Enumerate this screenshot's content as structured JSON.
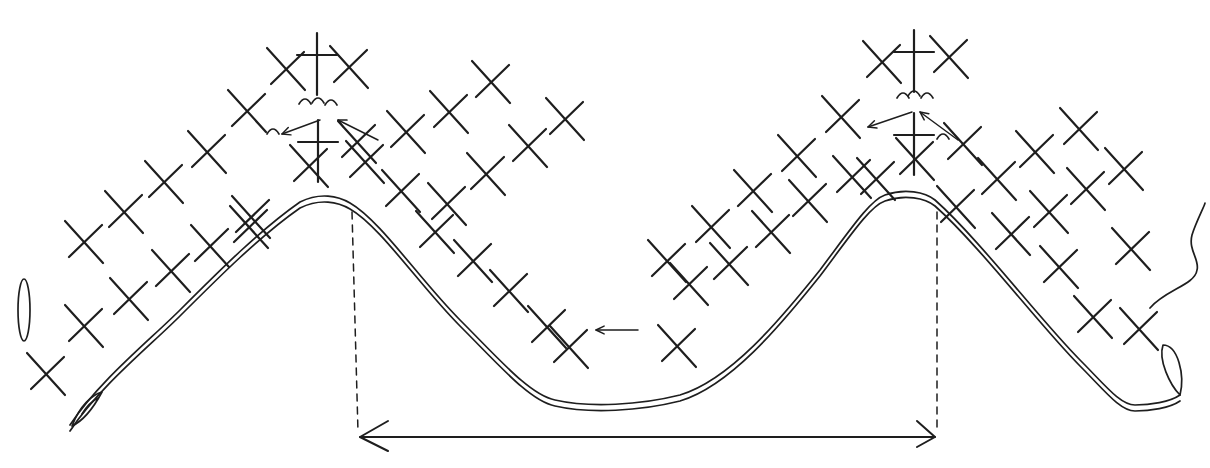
{
  "diagram": {
    "title": "",
    "type": "crochet-stitch-chart",
    "ink_color": "#1e1e1e",
    "background": "#ffffff",
    "symbols": {
      "sc": "single-crochet-x",
      "tr": "treble-cross",
      "ch": "chain-oval",
      "join": "hook-join-mark",
      "loop": "loop-end"
    },
    "single_crochet": [
      [
        47,
        375
      ],
      [
        85,
        327
      ],
      [
        130,
        300
      ],
      [
        172,
        272
      ],
      [
        211,
        247
      ],
      [
        252,
        218
      ],
      [
        85,
        243
      ],
      [
        125,
        213
      ],
      [
        165,
        183
      ],
      [
        208,
        153
      ],
      [
        248,
        112
      ],
      [
        287,
        70
      ],
      [
        350,
        68
      ],
      [
        358,
        143
      ],
      [
        310,
        167
      ],
      [
        250,
        228
      ],
      [
        366,
        163
      ],
      [
        407,
        133
      ],
      [
        450,
        113
      ],
      [
        492,
        83
      ],
      [
        402,
        192
      ],
      [
        436,
        233
      ],
      [
        474,
        262
      ],
      [
        510,
        292
      ],
      [
        548,
        328
      ],
      [
        570,
        348
      ],
      [
        448,
        205
      ],
      [
        487,
        175
      ],
      [
        529,
        147
      ],
      [
        566,
        120
      ],
      [
        678,
        347
      ],
      [
        690,
        285
      ],
      [
        730,
        265
      ],
      [
        772,
        233
      ],
      [
        809,
        202
      ],
      [
        853,
        178
      ],
      [
        668,
        262
      ],
      [
        712,
        228
      ],
      [
        754,
        192
      ],
      [
        798,
        157
      ],
      [
        842,
        118
      ],
      [
        883,
        63
      ],
      [
        950,
        58
      ],
      [
        964,
        145
      ],
      [
        916,
        160
      ],
      [
        877,
        180
      ],
      [
        957,
        208
      ],
      [
        998,
        180
      ],
      [
        1036,
        153
      ],
      [
        1080,
        130
      ],
      [
        1012,
        235
      ],
      [
        1050,
        213
      ],
      [
        1087,
        190
      ],
      [
        1125,
        170
      ],
      [
        1132,
        250
      ],
      [
        1140,
        330
      ],
      [
        1094,
        318
      ],
      [
        1060,
        268
      ]
    ],
    "treble_crochet": [
      [
        317,
        55
      ],
      [
        318,
        142
      ],
      [
        914,
        52
      ],
      [
        914,
        135
      ]
    ],
    "chain_path": "M70,425 C100,380 150,340 180,310 C220,270 260,230 300,202 C320,192 338,196 350,203 C380,220 420,280 460,320 C500,360 530,395 555,400 C590,408 640,405 680,395 C730,380 780,320 820,270 C850,230 870,200 885,195 C905,188 925,192 935,200 C980,240 1040,320 1080,360 C1105,385 1120,405 1135,405 C1150,405 1170,402 1180,395",
    "chain_nodes_left": [
      [
        70,
        425
      ],
      [
        100,
        395
      ],
      [
        130,
        365
      ],
      [
        160,
        340
      ],
      [
        190,
        310
      ],
      [
        220,
        280
      ],
      [
        260,
        240
      ],
      [
        300,
        202
      ],
      [
        350,
        203
      ]
    ],
    "chain_nodes_valley": [
      [
        390,
        238
      ],
      [
        430,
        280
      ],
      [
        470,
        325
      ],
      [
        510,
        370
      ],
      [
        555,
        400
      ],
      [
        615,
        406
      ],
      [
        680,
        395
      ],
      [
        720,
        355
      ],
      [
        760,
        310
      ],
      [
        800,
        270
      ],
      [
        845,
        225
      ],
      [
        885,
        195
      ],
      [
        935,
        200
      ]
    ],
    "chain_nodes_right": [
      [
        970,
        235
      ],
      [
        1005,
        270
      ],
      [
        1040,
        310
      ],
      [
        1080,
        355
      ],
      [
        1130,
        405
      ],
      [
        1180,
        395
      ]
    ],
    "repeat_markers": {
      "left_x": 352,
      "right_x": 937,
      "dashed_top": 212,
      "dashed_bottom": 432,
      "dimension_y": 437
    },
    "direction_arrows": [
      {
        "from": [
          320,
          120
        ],
        "to": [
          282,
          134
        ]
      },
      {
        "from": [
          378,
          140
        ],
        "to": [
          338,
          120
        ]
      },
      {
        "from": [
          912,
          112
        ],
        "to": [
          868,
          127
        ]
      },
      {
        "from": [
          958,
          140
        ],
        "to": [
          920,
          112
        ]
      },
      {
        "from": [
          638,
          330
        ],
        "to": [
          596,
          330
        ]
      }
    ],
    "start_loop_left": [
      20,
      310
    ],
    "end_tail_right": [
      1198,
      250
    ]
  }
}
